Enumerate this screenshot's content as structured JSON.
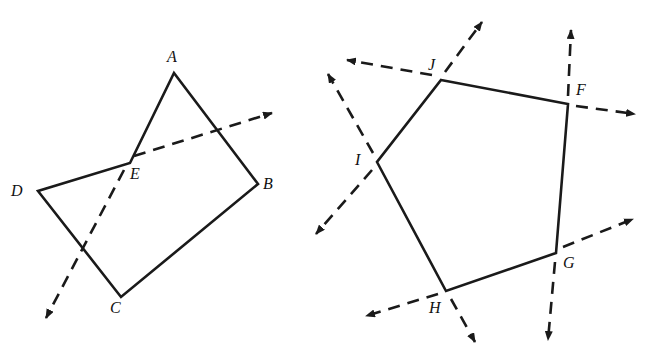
{
  "figures": [
    {
      "name": "quadrilateral-ABCD-with-exterior-angle-at-E",
      "labels": {
        "A": "A",
        "B": "B",
        "C": "C",
        "D": "D",
        "E": "E"
      },
      "stroke_color": "#1a1a1a"
    },
    {
      "name": "pentagon-FGHIJ-with-exterior-angles",
      "labels": {
        "F": "F",
        "G": "G",
        "H": "H",
        "I": "I",
        "J": "J"
      },
      "stroke_color": "#1a1a1a"
    }
  ]
}
